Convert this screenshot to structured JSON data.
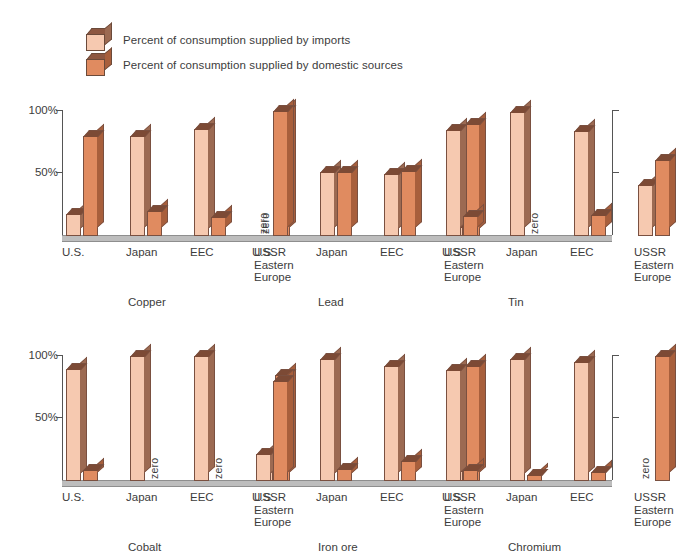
{
  "legend": {
    "items": [
      {
        "icon": "cube-icon-light",
        "label": "Percent of consumption supplied by imports",
        "color": "#f6c9b0"
      },
      {
        "icon": "cube-icon-dark",
        "label": "Percent of consumption supplied by domestic sources",
        "color": "#e08b60"
      }
    ]
  },
  "axis": {
    "tick_100": "100%",
    "tick_50": "50%"
  },
  "zero_label": "zero",
  "regions": [
    "U.S.",
    "Japan",
    "EEC",
    "USSR\nEastern\nEurope"
  ],
  "chart_data": {
    "type": "bar",
    "title": "",
    "xlabel": "",
    "ylabel": "",
    "ylim": [
      0,
      100
    ],
    "yticks": [
      50,
      100
    ],
    "ytick_labels": [
      "50%",
      "100%"
    ],
    "grid": false,
    "legend_position": "top-left",
    "categories": [
      "U.S.",
      "Japan",
      "EEC",
      "USSR Eastern Europe"
    ],
    "series": [
      {
        "name": "Percent of consumption supplied by imports",
        "color": "#f6c9b0"
      },
      {
        "name": "Percent of consumption supplied by domestic sources",
        "color": "#e08b60"
      }
    ],
    "panels": [
      {
        "commodity": "Copper",
        "values": {
          "imports": [
            18,
            80,
            86,
            0
          ],
          "domestic": [
            80,
            20,
            15,
            100
          ]
        },
        "zero": {
          "imports": [
            false,
            false,
            false,
            true
          ],
          "domestic": [
            false,
            false,
            false,
            false
          ]
        }
      },
      {
        "commodity": "Lead",
        "values": {
          "imports": [
            0,
            51,
            50,
            7
          ],
          "domestic": [
            100,
            51,
            52,
            90
          ]
        },
        "zero": {
          "imports": [
            true,
            false,
            false,
            false
          ],
          "domestic": [
            false,
            false,
            false,
            false
          ]
        }
      },
      {
        "commodity": "Tin",
        "values": {
          "imports": [
            85,
            99,
            84,
            41
          ],
          "domestic": [
            16,
            0,
            17,
            61
          ]
        },
        "zero": {
          "imports": [
            false,
            false,
            false,
            false
          ],
          "domestic": [
            false,
            true,
            false,
            false
          ]
        }
      },
      {
        "commodity": "Cobalt",
        "values": {
          "imports": [
            90,
            100,
            100,
            12
          ],
          "domestic": [
            9,
            0,
            0,
            85
          ]
        },
        "zero": {
          "imports": [
            false,
            false,
            false,
            false
          ],
          "domestic": [
            false,
            true,
            true,
            false
          ]
        }
      },
      {
        "commodity": "Iron ore",
        "values": {
          "imports": [
            22,
            98,
            92,
            8
          ],
          "domestic": [
            80,
            10,
            16,
            92
          ]
        },
        "zero": {
          "imports": [
            false,
            false,
            false,
            false
          ],
          "domestic": [
            false,
            false,
            false,
            false
          ]
        }
      },
      {
        "commodity": "Chromium",
        "values": {
          "imports": [
            89,
            98,
            95,
            0
          ],
          "domestic": [
            9,
            5,
            7,
            100
          ]
        },
        "zero": {
          "imports": [
            false,
            false,
            false,
            true
          ],
          "domestic": [
            false,
            false,
            false,
            false
          ]
        }
      }
    ]
  }
}
